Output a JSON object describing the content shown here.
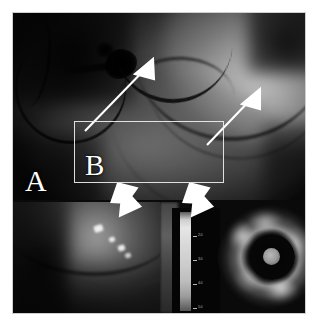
{
  "figure": {
    "kind": "multi-panel-medical-figure",
    "width": 317,
    "height": 323,
    "background_color": "#ffffff",
    "plate_background_color": "#0a0a0a"
  },
  "panels": [
    {
      "id": "A",
      "label": "A",
      "name": "coronary-angiogram-overview",
      "modality": "angiography"
    },
    {
      "id": "B",
      "label": "B",
      "name": "region-of-interest-box",
      "modality": "angiography-roi",
      "box_color": "#eeeeee"
    },
    {
      "id": "C",
      "label": "C",
      "name": "magnified-angiogram",
      "modality": "angiography-magnified"
    },
    {
      "id": "D",
      "label": "D",
      "name": "ivus-cross-section",
      "modality": "intravascular-ultrasound"
    }
  ],
  "annotations": {
    "thin_arrows": [
      {
        "name": "thin-arrow-left",
        "points_to": "proximal-lesion"
      },
      {
        "name": "thin-arrow-right",
        "points_to": "distal-lesion"
      }
    ],
    "thick_arrows": [
      {
        "name": "thick-arrow-left",
        "points_to": "panel-c"
      },
      {
        "name": "thick-arrow-right",
        "points_to": "panel-d"
      }
    ],
    "arrow_color": "#ffffff",
    "label_color": "#ffffff"
  },
  "scale_bar": {
    "name": "grayscale-depth-scale",
    "orientation": "vertical",
    "ticks": [
      {
        "label": "1.0"
      },
      {
        "label": "2.0"
      },
      {
        "label": "3.0"
      },
      {
        "label": "4.0"
      },
      {
        "label": "5.0"
      }
    ]
  },
  "ivus": {
    "lumen": "dark-central-lumen",
    "catheter": "gray-imaging-catheter",
    "plaque": "circumferential-echogenic-plaque"
  }
}
